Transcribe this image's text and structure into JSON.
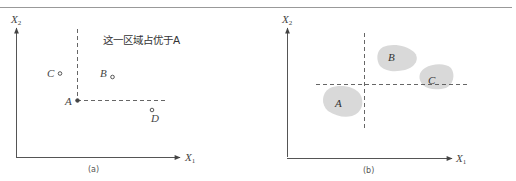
{
  "figure": {
    "panel_a": {
      "caption": "(a)",
      "axis_x_label": "X",
      "axis_x_sub": "1",
      "axis_y_label": "X",
      "axis_y_sub": "2",
      "annotation": "这一区域占优于A",
      "points": [
        {
          "label": "A",
          "x": 77,
          "y": 100,
          "style": "filled-reference"
        },
        {
          "label": "B",
          "x": 112,
          "y": 77,
          "style": "open-circle"
        },
        {
          "label": "C",
          "x": 60,
          "y": 74,
          "style": "open-circle"
        },
        {
          "label": "D",
          "x": 152,
          "y": 110,
          "style": "open-circle"
        }
      ]
    },
    "panel_b": {
      "caption": "(b)",
      "axis_x_label": "X",
      "axis_x_sub": "1",
      "axis_y_label": "X",
      "axis_y_sub": "2",
      "regions": [
        {
          "label": "A",
          "fill": "#d9d9d9"
        },
        {
          "label": "B",
          "fill": "#d9d9d9"
        },
        {
          "label": "C",
          "fill": "#d9d9d9"
        }
      ]
    },
    "colors": {
      "axis": "#555555",
      "dashed": "#555555",
      "region_fill": "#d9d9d9",
      "rule": "#999999"
    }
  }
}
